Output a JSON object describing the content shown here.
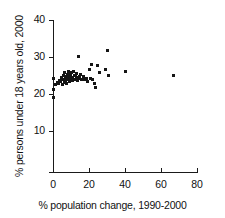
{
  "chart_data": {
    "type": "scatter",
    "title": "",
    "xlabel": "% population change, 1990-2000",
    "ylabel": "% persons under 18 years old, 2000",
    "xlim": [
      0,
      80
    ],
    "ylim": [
      0,
      40
    ],
    "xticks": [
      0,
      20,
      40,
      60,
      80
    ],
    "yticks": [
      10,
      20,
      30,
      40
    ],
    "xtick_labels": [
      "0",
      "20",
      "40",
      "60",
      "80"
    ],
    "ytick_labels": [
      "10",
      "20",
      "30",
      "40"
    ],
    "grid": false,
    "legend": null,
    "marker": "square",
    "marker_color": "#151515",
    "points": [
      {
        "x": 0.2,
        "y": 24.2
      },
      {
        "x": 0.3,
        "y": 21.3
      },
      {
        "x": 0.4,
        "y": 19.1
      },
      {
        "x": 1.6,
        "y": 22.6
      },
      {
        "x": 2.6,
        "y": 23.2
      },
      {
        "x": 3.2,
        "y": 22.9
      },
      {
        "x": 3.8,
        "y": 23.6
      },
      {
        "x": 4.4,
        "y": 23.4
      },
      {
        "x": 4.8,
        "y": 24.4
      },
      {
        "x": 5.1,
        "y": 22.7
      },
      {
        "x": 5.5,
        "y": 23.9
      },
      {
        "x": 5.9,
        "y": 24.9
      },
      {
        "x": 6.2,
        "y": 23.1
      },
      {
        "x": 6.5,
        "y": 25.8
      },
      {
        "x": 6.8,
        "y": 24.1
      },
      {
        "x": 7.1,
        "y": 23.5
      },
      {
        "x": 7.4,
        "y": 24.6
      },
      {
        "x": 7.6,
        "y": 22.8
      },
      {
        "x": 7.9,
        "y": 25.2
      },
      {
        "x": 8.2,
        "y": 23.8
      },
      {
        "x": 8.5,
        "y": 24.3
      },
      {
        "x": 8.8,
        "y": 26.0
      },
      {
        "x": 9.0,
        "y": 23.3
      },
      {
        "x": 9.3,
        "y": 24.8
      },
      {
        "x": 9.6,
        "y": 25.4
      },
      {
        "x": 9.9,
        "y": 23.9
      },
      {
        "x": 10.2,
        "y": 24.5
      },
      {
        "x": 10.5,
        "y": 25.9
      },
      {
        "x": 10.8,
        "y": 23.6
      },
      {
        "x": 11.1,
        "y": 24.2
      },
      {
        "x": 11.4,
        "y": 26.2
      },
      {
        "x": 11.7,
        "y": 24.9
      },
      {
        "x": 12.0,
        "y": 23.8
      },
      {
        "x": 12.4,
        "y": 25.1
      },
      {
        "x": 12.8,
        "y": 24.4
      },
      {
        "x": 13.2,
        "y": 25.6
      },
      {
        "x": 13.6,
        "y": 23.7
      },
      {
        "x": 14.0,
        "y": 24.1
      },
      {
        "x": 14.3,
        "y": 30.2
      },
      {
        "x": 14.6,
        "y": 24.7
      },
      {
        "x": 15.2,
        "y": 25.3
      },
      {
        "x": 15.8,
        "y": 24.0
      },
      {
        "x": 16.4,
        "y": 23.9
      },
      {
        "x": 17.0,
        "y": 24.6
      },
      {
        "x": 17.8,
        "y": 23.8
      },
      {
        "x": 18.6,
        "y": 24.2
      },
      {
        "x": 19.4,
        "y": 23.5
      },
      {
        "x": 20.4,
        "y": 26.6
      },
      {
        "x": 20.8,
        "y": 24.1
      },
      {
        "x": 21.6,
        "y": 27.9
      },
      {
        "x": 22.2,
        "y": 23.9
      },
      {
        "x": 23.0,
        "y": 22.9
      },
      {
        "x": 23.6,
        "y": 21.7
      },
      {
        "x": 24.6,
        "y": 27.7
      },
      {
        "x": 25.8,
        "y": 25.7
      },
      {
        "x": 29.4,
        "y": 26.6
      },
      {
        "x": 30.0,
        "y": 31.8
      },
      {
        "x": 30.6,
        "y": 24.9
      },
      {
        "x": 40.2,
        "y": 26.0
      },
      {
        "x": 67.0,
        "y": 24.9
      }
    ]
  }
}
